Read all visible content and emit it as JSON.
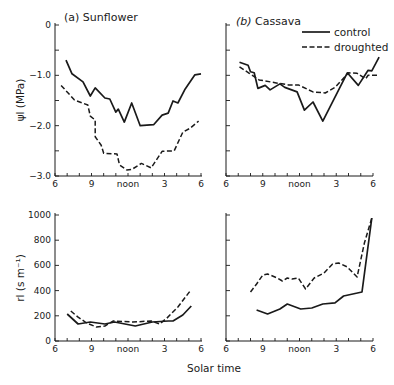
{
  "figure": {
    "xlabel": "Solar time",
    "legend": {
      "entries": [
        {
          "label": "control",
          "style": "solid"
        },
        {
          "label": "droughted",
          "style": "dashed"
        }
      ]
    }
  },
  "chart_data": [
    {
      "type": "line",
      "panel": "top-left",
      "title_prefix": "(a)",
      "title": "Sunflower",
      "xlabel": "",
      "ylabel": "ψl (MPa)",
      "x_ticks": [
        6,
        9,
        12,
        15,
        18
      ],
      "x_tick_labels": [
        "6",
        "9",
        "noon",
        "3",
        "6"
      ],
      "y_ticks": [
        0,
        -1.0,
        -2.0,
        -3.0
      ],
      "y_tick_labels": [
        "0",
        "−1.0",
        "−2.0",
        "−3.0"
      ],
      "xlim": [
        6,
        18
      ],
      "ylim": [
        -3.0,
        0
      ],
      "series": [
        {
          "name": "control",
          "style": "solid",
          "x": [
            6.9,
            7.4,
            8.3,
            8.9,
            9.3,
            10.1,
            10.5,
            11.0,
            11.2,
            11.7,
            12.3,
            13.0,
            14.1,
            14.8,
            15.3,
            15.7,
            16.1,
            16.7,
            17.5,
            18.0
          ],
          "y": [
            -0.7,
            -0.97,
            -1.13,
            -1.41,
            -1.25,
            -1.45,
            -1.47,
            -1.73,
            -1.67,
            -1.93,
            -1.55,
            -2.0,
            -1.98,
            -1.79,
            -1.75,
            -1.51,
            -1.55,
            -1.27,
            -0.99,
            -0.97
          ]
        },
        {
          "name": "droughted",
          "style": "dashed",
          "x": [
            6.5,
            7.6,
            8.7,
            8.9,
            9.3,
            9.3,
            9.8,
            10.0,
            11.1,
            11.3,
            11.9,
            12.3,
            13.1,
            13.9,
            14.8,
            15.8,
            16.5,
            17.1,
            17.8
          ],
          "y": [
            -1.2,
            -1.49,
            -1.59,
            -1.81,
            -1.89,
            -2.22,
            -2.39,
            -2.55,
            -2.56,
            -2.78,
            -2.88,
            -2.87,
            -2.75,
            -2.84,
            -2.51,
            -2.5,
            -2.13,
            -2.05,
            -1.91
          ]
        }
      ]
    },
    {
      "type": "line",
      "panel": "top-right",
      "title_prefix": "(b)",
      "title": "Cassava",
      "xlabel": "",
      "ylabel": "",
      "x_ticks": [
        6,
        9,
        12,
        15,
        18
      ],
      "x_tick_labels": [
        "6",
        "9",
        "noon",
        "3",
        "6"
      ],
      "y_ticks": [
        0,
        -1.0,
        -2.0,
        -3.0
      ],
      "y_tick_labels": [],
      "xlim": [
        6,
        18.6
      ],
      "ylim": [
        -3.0,
        0
      ],
      "series": [
        {
          "name": "control",
          "style": "solid",
          "x": [
            7.1,
            7.8,
            8.0,
            8.3,
            8.6,
            9.2,
            9.6,
            10.4,
            10.8,
            11.8,
            12.4,
            13.1,
            13.9,
            15.9,
            16.8,
            17.6,
            17.9,
            18.5
          ],
          "y": [
            -0.74,
            -0.8,
            -0.93,
            -0.95,
            -1.26,
            -1.2,
            -1.29,
            -1.17,
            -1.24,
            -1.33,
            -1.69,
            -1.53,
            -1.91,
            -0.95,
            -1.2,
            -0.9,
            -0.91,
            -0.64
          ]
        },
        {
          "name": "droughted",
          "style": "dashed",
          "x": [
            7.1,
            7.9,
            8.7,
            10.1,
            11.1,
            11.9,
            13.1,
            14.1,
            14.9,
            16.0,
            16.7,
            17.4,
            17.6,
            18.4
          ],
          "y": [
            -0.83,
            -0.96,
            -1.09,
            -1.15,
            -1.19,
            -1.19,
            -1.33,
            -1.35,
            -1.24,
            -0.95,
            -0.96,
            -1.07,
            -1.0,
            -1.0
          ]
        }
      ]
    },
    {
      "type": "line",
      "panel": "bottom-left",
      "title": "",
      "xlabel": "",
      "ylabel": "rl (s m⁻¹)",
      "x_ticks": [
        6,
        9,
        12,
        15,
        18
      ],
      "x_tick_labels": [
        "6",
        "9",
        "noon",
        "3",
        "6"
      ],
      "y_ticks": [
        0,
        200,
        400,
        600,
        800,
        1000
      ],
      "y_tick_labels": [
        "0",
        "200",
        "400",
        "600",
        "800",
        "1000"
      ],
      "xlim": [
        6,
        18
      ],
      "ylim": [
        0,
        1000
      ],
      "series": [
        {
          "name": "control",
          "style": "solid",
          "x": [
            7.0,
            7.9,
            8.9,
            10.1,
            10.9,
            12.6,
            14.0,
            15.3,
            15.7,
            16.5,
            17.2
          ],
          "y": [
            214,
            135,
            151,
            135,
            151,
            119,
            151,
            159,
            159,
            206,
            278
          ]
        },
        {
          "name": "droughted",
          "style": "dashed",
          "x": [
            7.3,
            7.9,
            8.6,
            9.4,
            10.1,
            10.8,
            12.4,
            13.9,
            14.6,
            15.2,
            16.1,
            17.1
          ],
          "y": [
            238,
            190,
            143,
            111,
            119,
            159,
            151,
            159,
            135,
            182,
            270,
            397
          ]
        }
      ]
    },
    {
      "type": "line",
      "panel": "bottom-right",
      "title": "",
      "xlabel": "",
      "ylabel": "",
      "x_ticks": [
        6,
        9,
        12,
        15,
        18
      ],
      "x_tick_labels": [
        "6",
        "9",
        "noon",
        "3",
        "6"
      ],
      "y_ticks": [
        0,
        200,
        400,
        600,
        800,
        1000
      ],
      "y_tick_labels": [],
      "xlim": [
        6,
        18
      ],
      "ylim": [
        0,
        1000
      ],
      "series": [
        {
          "name": "control",
          "style": "solid",
          "x": [
            8.5,
            9.4,
            10.0,
            10.4,
            11.0,
            12.1,
            13.0,
            13.9,
            14.9,
            15.6,
            17.1,
            17.9
          ],
          "y": [
            246,
            214,
            238,
            254,
            294,
            254,
            262,
            294,
            302,
            357,
            389,
            976
          ]
        },
        {
          "name": "droughted",
          "style": "dashed",
          "x": [
            8.0,
            8.5,
            9.0,
            9.4,
            10.2,
            10.6,
            11.0,
            11.4,
            11.9,
            12.5,
            13.2,
            14.0,
            14.7,
            15.2,
            15.9,
            16.7,
            17.3,
            17.9
          ],
          "y": [
            389,
            452,
            524,
            532,
            500,
            476,
            500,
            492,
            500,
            413,
            500,
            540,
            611,
            619,
            587,
            508,
            778,
            976
          ]
        }
      ]
    }
  ]
}
